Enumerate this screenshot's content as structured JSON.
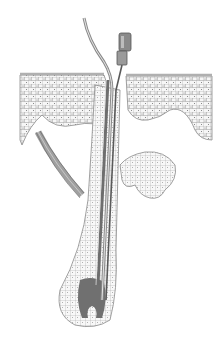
{
  "figure": {
    "colors": {
      "background": "#ffffff",
      "cell_line": "#8a8a8a",
      "cell_fill": "#f4f4f4",
      "skin_surface": "#b8b8b8",
      "hair_shaft": "#6e6e6e",
      "probe_metal": "#9a9a9a",
      "probe_dark": "#5a5a5a",
      "muscle": "#7a7a7a",
      "bulb": "#707070"
    }
  }
}
